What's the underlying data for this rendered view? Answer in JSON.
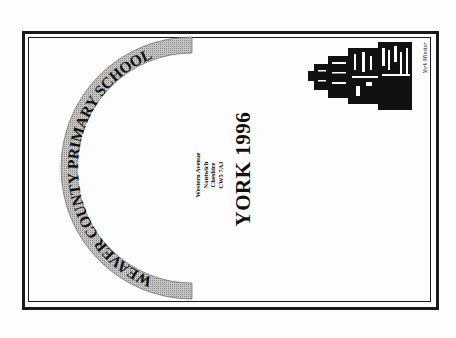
{
  "document": {
    "school_name": "WEAVER COUNTY PRIMARY SCHOOL",
    "address": {
      "lines": [
        "Western Avenue",
        "Nantwich",
        "Cheshire",
        "CW5 7AJ"
      ]
    },
    "title": "YORK 1996",
    "illustration": {
      "icon": "york-minster-illustration",
      "caption": "York Minster"
    }
  },
  "colors": {
    "band_fill": "#b5b5b5",
    "border": "#1a1a1a",
    "text": "#111111",
    "background": "#fdfdfd"
  }
}
